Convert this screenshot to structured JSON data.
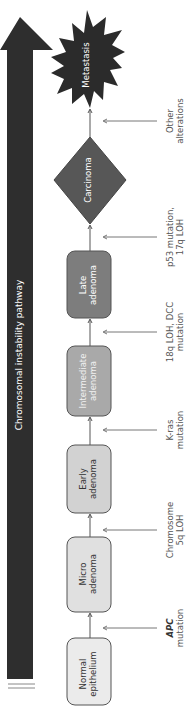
{
  "pathway": {
    "label": "Chromosomal instability pathway",
    "arrow_color": "#2e2e2e"
  },
  "stages": [
    {
      "id": "normal",
      "line1": "Normal",
      "line2": "epithelium",
      "shape": "rounded-rect",
      "fill": "#ebebeb",
      "text_color": "#333333"
    },
    {
      "id": "micro",
      "line1": "Micro",
      "line2": "adenoma",
      "shape": "rounded-rect",
      "fill": "#e0e0e0",
      "text_color": "#333333"
    },
    {
      "id": "early",
      "line1": "Early",
      "line2": "adenoma",
      "shape": "rounded-rect",
      "fill": "#d2d2d2",
      "text_color": "#333333"
    },
    {
      "id": "intermediate",
      "line1": "Intermediate",
      "line2": "adenoma",
      "shape": "rounded-rect",
      "fill": "#a9a9a9",
      "text_color": "#f2f2f2"
    },
    {
      "id": "late",
      "line1": "Late",
      "line2": "adenoma",
      "shape": "rounded-rect",
      "fill": "#7d7d7d",
      "text_color": "#ffffff"
    },
    {
      "id": "carcinoma",
      "line1": "Carcinoma",
      "line2": "",
      "shape": "diamond",
      "fill": "#575757",
      "text_color": "#ffffff"
    },
    {
      "id": "metastasis",
      "line1": "Metastasis",
      "line2": "",
      "shape": "star",
      "fill": "#2b2b2b",
      "text_color": "#ffffff"
    }
  ],
  "alterations": [
    {
      "id": "apc",
      "line1": "APC",
      "line2": "mutation",
      "line1_style": "italic-bold"
    },
    {
      "id": "5q",
      "line1": "Chromosome",
      "line2": "5q LOH"
    },
    {
      "id": "kras",
      "line1": "K-ras",
      "line2": "mutation"
    },
    {
      "id": "18q",
      "line1": "18q LOH, DCC",
      "line2": "mutation"
    },
    {
      "id": "p53",
      "line1": "p53 mutation,",
      "line2": "17q LOH"
    },
    {
      "id": "other",
      "line1": "Other",
      "line2": "alterations"
    }
  ],
  "colors": {
    "connector": "#555555",
    "box_border": "#555555",
    "side_arrow": "#777777"
  }
}
